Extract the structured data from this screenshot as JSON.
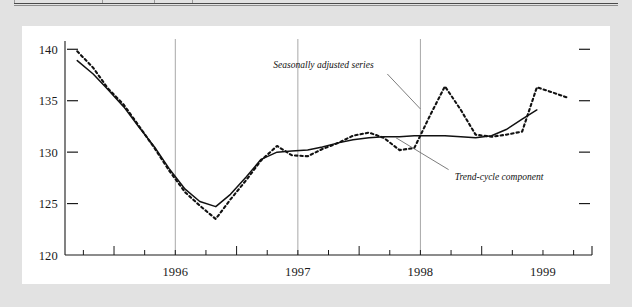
{
  "figure": {
    "background_color": "#e2e2e2",
    "card_color": "#ffffff",
    "axis_color": "#1a1a1a",
    "gridline_color": "#a8a8a8",
    "series_color": "#111111"
  },
  "annotations": {
    "seasonal_label": "Seasonally adjusted series",
    "trend_label": "Trend-cycle component"
  },
  "chart_data": {
    "type": "line",
    "title": "",
    "subtitle": "",
    "xlabel": "",
    "ylabel": "",
    "ylim": [
      120,
      141
    ],
    "yticks": [
      120,
      125,
      130,
      135,
      140
    ],
    "ytick_labels": [
      "120",
      "125",
      "130",
      "135",
      "140"
    ],
    "xlim": [
      1995.6,
      1999.9
    ],
    "xtick_labels": [
      "1996",
      "1997",
      "1998",
      "1999"
    ],
    "xtick_positions": [
      1996.0,
      1997.0,
      1998.0,
      1999.0
    ],
    "minor_xticks": [
      1995.75,
      1996.0,
      1996.25,
      1996.5,
      1996.75,
      1997.0,
      1997.25,
      1997.5,
      1997.75,
      1998.0,
      1998.25,
      1998.5,
      1998.75,
      1999.0,
      1999.25,
      1999.5,
      1999.75
    ],
    "vertical_gridlines": [
      1996.5,
      1997.5,
      1998.5
    ],
    "grid": false,
    "legend_position": "inline-annotation",
    "series": [
      {
        "name": "Seasonally adjusted series",
        "style": "dashed",
        "x": [
          1995.7,
          1995.83,
          1995.95,
          1996.08,
          1996.2,
          1996.33,
          1996.45,
          1996.58,
          1996.7,
          1996.83,
          1996.95,
          1997.08,
          1997.2,
          1997.33,
          1997.45,
          1997.58,
          1997.7,
          1997.83,
          1997.95,
          1998.08,
          1998.2,
          1998.33,
          1998.45,
          1998.58,
          1998.7,
          1998.83,
          1998.95,
          1999.08,
          1999.2,
          1999.33,
          1999.45,
          1999.58,
          1999.7
        ],
        "values": [
          139.8,
          138.2,
          136.2,
          134.6,
          132.6,
          130.4,
          128.2,
          126.1,
          124.8,
          123.5,
          125.4,
          127.3,
          129.2,
          130.6,
          129.7,
          129.6,
          130.3,
          130.9,
          131.6,
          131.9,
          131.4,
          130.2,
          130.4,
          133.6,
          136.4,
          134.1,
          131.7,
          131.5,
          131.7,
          132.0,
          136.3,
          135.8,
          135.3
        ]
      },
      {
        "name": "Trend-cycle component",
        "style": "solid",
        "x": [
          1995.7,
          1995.83,
          1995.95,
          1996.08,
          1996.2,
          1996.33,
          1996.45,
          1996.58,
          1996.7,
          1996.83,
          1996.95,
          1997.08,
          1997.2,
          1997.33,
          1997.45,
          1997.58,
          1997.7,
          1997.83,
          1997.95,
          1998.08,
          1998.2,
          1998.33,
          1998.45,
          1998.58,
          1998.7,
          1998.83,
          1998.95,
          1999.08,
          1999.2,
          1999.33,
          1999.45
        ],
        "values": [
          138.9,
          137.6,
          136.1,
          134.4,
          132.5,
          130.5,
          128.4,
          126.4,
          125.2,
          124.7,
          125.9,
          127.6,
          129.3,
          130.0,
          130.1,
          130.2,
          130.5,
          130.9,
          131.2,
          131.4,
          131.5,
          131.5,
          131.6,
          131.6,
          131.6,
          131.5,
          131.4,
          131.6,
          132.2,
          133.2,
          134.1
        ]
      }
    ]
  }
}
